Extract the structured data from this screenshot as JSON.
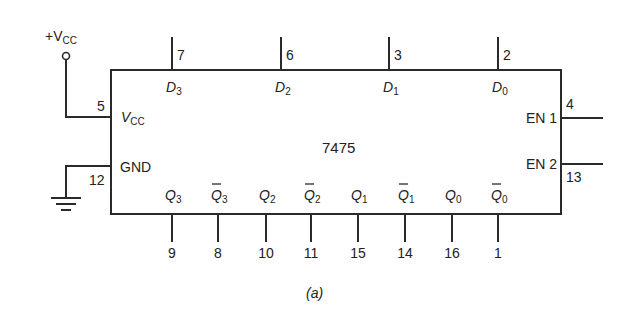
{
  "figure": {
    "caption": "(a)",
    "chip": {
      "part_number": "7475",
      "box": {
        "x": 111,
        "y": 70,
        "width": 450,
        "height": 144
      }
    },
    "supply": {
      "label_prefix": "+V",
      "label_sub": "CC",
      "vcc_pin": {
        "number": "5",
        "name_main": "V",
        "name_sub": "CC"
      },
      "gnd_pin": {
        "number": "12",
        "name": "GND"
      }
    },
    "data_inputs": [
      {
        "name_main": "D",
        "name_sub": "3",
        "pin": "7",
        "x": 172
      },
      {
        "name_main": "D",
        "name_sub": "2",
        "pin": "6",
        "x": 281
      },
      {
        "name_main": "D",
        "name_sub": "1",
        "pin": "3",
        "x": 389
      },
      {
        "name_main": "D",
        "name_sub": "0",
        "pin": "2",
        "x": 498
      }
    ],
    "enables": [
      {
        "name": "EN 1",
        "pin": "4",
        "y": 118
      },
      {
        "name": "EN 2",
        "pin": "13",
        "y": 164
      }
    ],
    "outputs": [
      {
        "name_main": "Q",
        "name_sub": "3",
        "inverted": false,
        "pin": "9",
        "x": 172
      },
      {
        "name_main": "Q",
        "name_sub": "3",
        "inverted": true,
        "pin": "8",
        "x": 218
      },
      {
        "name_main": "Q",
        "name_sub": "2",
        "inverted": false,
        "pin": "10",
        "x": 266
      },
      {
        "name_main": "Q",
        "name_sub": "2",
        "inverted": true,
        "pin": "11",
        "x": 311
      },
      {
        "name_main": "Q",
        "name_sub": "1",
        "inverted": false,
        "pin": "15",
        "x": 358
      },
      {
        "name_main": "Q",
        "name_sub": "1",
        "inverted": true,
        "pin": "14",
        "x": 405
      },
      {
        "name_main": "Q",
        "name_sub": "0",
        "inverted": false,
        "pin": "16",
        "x": 452
      },
      {
        "name_main": "Q",
        "name_sub": "0",
        "inverted": true,
        "pin": "1",
        "x": 498
      }
    ],
    "colors": {
      "line": "#2a2a2a",
      "text": "#222222",
      "background": "#ffffff"
    }
  }
}
